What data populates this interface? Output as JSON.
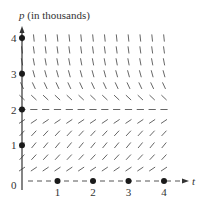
{
  "figure": {
    "type": "slope-field",
    "y_axis": {
      "label_var": "p",
      "label_unit": " (in thousands)",
      "ticks": [
        "0",
        "1",
        "2",
        "3",
        "4"
      ],
      "tick_values": [
        0,
        1,
        2,
        3,
        4
      ]
    },
    "x_axis": {
      "label_var": "t",
      "ticks": [
        "1",
        "2",
        "3",
        "4"
      ],
      "tick_values": [
        1,
        2,
        3,
        4
      ]
    },
    "equilibria": [
      0,
      2
    ],
    "colors": {
      "ink": "#333333",
      "segment": "#555555",
      "dot": "#1a1a1a"
    }
  },
  "layout": {
    "origin_x": 22,
    "origin_y": 181,
    "unit_x": 35.5,
    "unit_y": 35.75,
    "grid_step_t": 0.333333,
    "grid_step_p": 0.333333,
    "t_max": 4,
    "p_max": 4
  }
}
